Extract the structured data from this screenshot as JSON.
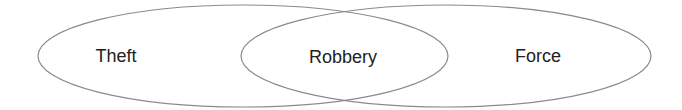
{
  "diagram": {
    "type": "venn",
    "sets": [
      {
        "label": "Theft",
        "cx": 243,
        "cy": 56,
        "rx": 205,
        "ry": 51,
        "label_x": 116,
        "label_y": 56
      },
      {
        "label": "Force",
        "cx": 446,
        "cy": 56,
        "rx": 205,
        "ry": 51,
        "label_x": 538,
        "label_y": 56
      }
    ],
    "intersection": {
      "label": "Robbery",
      "label_x": 343,
      "label_y": 57
    },
    "stroke_color": "#8a8a8a",
    "text_color": "#222222"
  }
}
